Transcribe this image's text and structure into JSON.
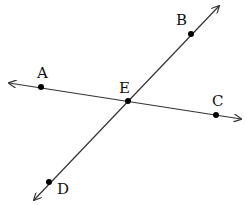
{
  "diagram": {
    "colors": {
      "line": "#333333",
      "point": "#000000",
      "label": "#111111",
      "background": "#ffffff"
    },
    "lines": [
      {
        "name": "line-AC",
        "from": [
          9,
          83
        ],
        "to": [
          241,
          119
        ],
        "arrows": "both"
      },
      {
        "name": "line-BD",
        "from": [
          34,
          200
        ],
        "to": [
          219,
          6
        ],
        "arrows": "both"
      }
    ],
    "points": [
      {
        "id": "A",
        "label": "A",
        "x": 41,
        "y": 87,
        "lx": 37,
        "ly": 78
      },
      {
        "id": "B",
        "label": "B",
        "x": 191,
        "y": 34,
        "lx": 176,
        "ly": 25
      },
      {
        "id": "C",
        "label": "C",
        "x": 216,
        "y": 115,
        "lx": 212,
        "ly": 106
      },
      {
        "id": "D",
        "label": "D",
        "x": 49,
        "y": 182,
        "lx": 57,
        "ly": 194
      },
      {
        "id": "E",
        "label": "E",
        "x": 128,
        "y": 101,
        "lx": 119,
        "ly": 93
      }
    ]
  }
}
